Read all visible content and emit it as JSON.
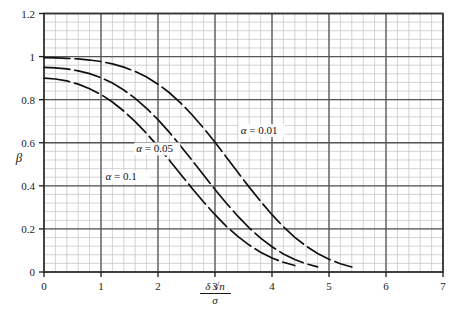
{
  "chart_data": {
    "type": "line",
    "title": "",
    "subtitle": "",
    "xlabel": "delta*sqrt(n)/sigma",
    "xlabel_parts": {
      "numerator": "δ √n",
      "denominator": "σ"
    },
    "ylabel": "β",
    "xlim": [
      0,
      7
    ],
    "ylim": [
      0,
      1.2
    ],
    "x_ticks": [
      "0",
      "1",
      "2",
      "3",
      "4",
      "5",
      "6",
      "7"
    ],
    "x_tick_values": [
      0,
      1,
      2,
      3,
      4,
      5,
      6,
      7
    ],
    "y_ticks": [
      "0",
      "0.2",
      "0.4",
      "0.6",
      "0.8",
      "1",
      "1.2"
    ],
    "y_tick_values": [
      0,
      0.2,
      0.4,
      0.6,
      0.8,
      1.0,
      1.2
    ],
    "grid": true,
    "grid_major_color": "#555555",
    "grid_minor_color": "#c8c8c8",
    "minor_divisions": 5,
    "legend_position": "inline-annotations",
    "line_style": "dashed",
    "line_color": "#111111",
    "series": [
      {
        "name": "α = 0.01",
        "label": "α = 0.01",
        "label_x": 3.45,
        "label_y": 0.64,
        "x": [
          0,
          0.2,
          0.4,
          0.6,
          0.8,
          1.0,
          1.2,
          1.4,
          1.6,
          1.8,
          2.0,
          2.2,
          2.4,
          2.6,
          2.8,
          3.0,
          3.2,
          3.4,
          3.6,
          3.8,
          4.0,
          4.2,
          4.4,
          4.6,
          4.8,
          5.0,
          5.2,
          5.4
        ],
        "values": [
          0.995,
          0.994,
          0.992,
          0.989,
          0.984,
          0.977,
          0.966,
          0.951,
          0.931,
          0.905,
          0.872,
          0.832,
          0.784,
          0.729,
          0.668,
          0.602,
          0.533,
          0.463,
          0.394,
          0.328,
          0.266,
          0.21,
          0.161,
          0.12,
          0.086,
          0.059,
          0.038,
          0.023
        ]
      },
      {
        "name": "α = 0.05",
        "label": "α = 0.05",
        "label_x": 1.62,
        "label_y": 0.555,
        "x": [
          0,
          0.2,
          0.4,
          0.6,
          0.8,
          1.0,
          1.2,
          1.4,
          1.6,
          1.8,
          2.0,
          2.2,
          2.4,
          2.6,
          2.8,
          3.0,
          3.2,
          3.4,
          3.6,
          3.8,
          4.0,
          4.2,
          4.4,
          4.6,
          4.8
        ],
        "values": [
          0.95,
          0.948,
          0.943,
          0.934,
          0.921,
          0.902,
          0.877,
          0.845,
          0.806,
          0.76,
          0.707,
          0.648,
          0.584,
          0.518,
          0.45,
          0.383,
          0.319,
          0.259,
          0.205,
          0.157,
          0.117,
          0.084,
          0.058,
          0.038,
          0.024
        ]
      },
      {
        "name": "α = 0.1",
        "label": "α = 0.1",
        "label_x": 1.08,
        "label_y": 0.425,
        "x": [
          0,
          0.2,
          0.4,
          0.6,
          0.8,
          1.0,
          1.2,
          1.4,
          1.6,
          1.8,
          2.0,
          2.2,
          2.4,
          2.6,
          2.8,
          3.0,
          3.2,
          3.4,
          3.6,
          3.8,
          4.0,
          4.2,
          4.4
        ],
        "values": [
          0.9,
          0.896,
          0.887,
          0.872,
          0.851,
          0.824,
          0.789,
          0.747,
          0.698,
          0.643,
          0.583,
          0.519,
          0.453,
          0.388,
          0.325,
          0.266,
          0.212,
          0.165,
          0.125,
          0.092,
          0.065,
          0.045,
          0.03
        ]
      }
    ]
  }
}
